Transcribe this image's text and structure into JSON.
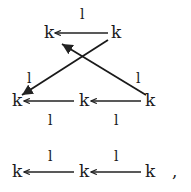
{
  "diagram": {
    "triangle": {
      "nodes": [
        {
          "id": "top-left",
          "label": "k"
        },
        {
          "id": "top-right",
          "label": "k"
        },
        {
          "id": "mid-left",
          "label": "k"
        },
        {
          "id": "mid-center",
          "label": "k"
        },
        {
          "id": "mid-right",
          "label": "k"
        }
      ],
      "edge_labels": {
        "top": "l",
        "left": "l",
        "right": "l",
        "bottom_left": "l",
        "bottom_right": "l"
      }
    },
    "sequence": {
      "nodes": [
        {
          "id": "seq-left",
          "label": "k"
        },
        {
          "id": "seq-center",
          "label": "k"
        },
        {
          "id": "seq-right",
          "label": "k"
        }
      ],
      "edge_labels": [
        "l",
        "l"
      ],
      "trailing_punctuation": ","
    }
  }
}
